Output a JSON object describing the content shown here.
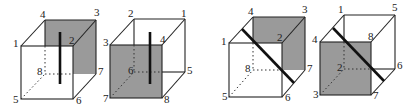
{
  "diagram": {
    "colors": {
      "shade": "#9a9a9a",
      "line": "#222222"
    },
    "cubes": [
      {
        "id": "cube-1",
        "labels": {
          "v1": "1",
          "v2": "2",
          "v3": "3",
          "v4": "4",
          "v5": "5",
          "v6": "6",
          "v7": "7",
          "v8": "8"
        },
        "shaded_face": "back (4-3-7-8)",
        "cut_line": "vertical"
      },
      {
        "id": "cube-2",
        "labels": {
          "v1": "1",
          "v2": "2",
          "v3": "3",
          "v4": "4",
          "v5": "5",
          "v6": "6",
          "v7": "7",
          "v8": "8"
        },
        "shaded_face": "front (3-4-8-7)",
        "cut_line": "vertical"
      },
      {
        "id": "cube-3",
        "labels": {
          "v1": "1",
          "v2": "2",
          "v3": "3",
          "v4": "4",
          "v5": "5",
          "v6": "6",
          "v7": "7",
          "v8": "8"
        },
        "shaded_face": "back (4-3-7-8)",
        "cut_line": "diagonal"
      },
      {
        "id": "cube-4",
        "labels": {
          "v1": "1",
          "v2": "2",
          "v3": "3",
          "v4": "4",
          "v5": "5",
          "v6": "6",
          "v7": "7",
          "v8": "8"
        },
        "shaded_face": "front (4-8-7-3)",
        "cut_line": "diagonal"
      }
    ]
  }
}
